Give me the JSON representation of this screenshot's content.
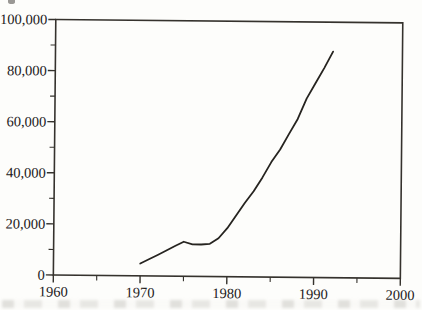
{
  "figure": {
    "background_color": "#fdfdfb",
    "axis_color": "#35322d",
    "line_color": "#262420",
    "text_color": "#24211c"
  },
  "chart_data": {
    "type": "line",
    "title": "",
    "xlabel": "",
    "ylabel": "",
    "xlim": [
      1960,
      2000
    ],
    "ylim": [
      0,
      100000
    ],
    "frame": "box",
    "grid": false,
    "legend_position": "none",
    "x_major_ticks": [
      1960,
      1970,
      1980,
      1990,
      2000
    ],
    "x_tick_labels": [
      "1960",
      "1970",
      "1980",
      "1990",
      "2000"
    ],
    "x_minor_ticks": [
      1965,
      1975,
      1985,
      1995
    ],
    "y_major_ticks": [
      0,
      20000,
      40000,
      60000,
      80000,
      100000
    ],
    "y_tick_labels": [
      "0",
      "20,000",
      "40,000",
      "60,000",
      "80,000",
      "100,000"
    ],
    "y_minor_ticks": [
      10000,
      30000,
      50000,
      70000,
      90000
    ],
    "series": [
      {
        "name": "value",
        "x": [
          1970,
          1971,
          1972,
          1973,
          1974,
          1975,
          1976,
          1977,
          1978,
          1979,
          1980,
          1981,
          1982,
          1983,
          1984,
          1985,
          1986,
          1987,
          1988,
          1989,
          1990,
          1991,
          1992
        ],
        "y": [
          4800,
          6500,
          8200,
          10000,
          11800,
          13500,
          12500,
          12500,
          12800,
          15000,
          19000,
          24000,
          29000,
          33500,
          39000,
          45000,
          50000,
          56000,
          62000,
          70000,
          76000,
          82000,
          88500
        ]
      }
    ]
  }
}
